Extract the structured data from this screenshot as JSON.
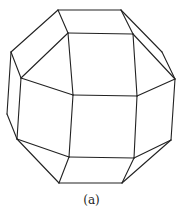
{
  "figure": {
    "type": "polyhedron-line-drawing",
    "stroke_color": "#222222",
    "caption": "(a)",
    "vertices": {
      "A": [
        58,
        10
      ],
      "B": [
        121,
        10
      ],
      "C": [
        68,
        33
      ],
      "D": [
        133,
        34
      ],
      "E": [
        11,
        52
      ],
      "F": [
        162,
        52
      ],
      "G": [
        21,
        78
      ],
      "H": [
        175,
        79
      ],
      "I": [
        73,
        95
      ],
      "J": [
        137,
        96
      ],
      "K": [
        7,
        114
      ],
      "L": [
        17,
        139
      ],
      "M": [
        69,
        157
      ],
      "N": [
        134,
        158
      ],
      "O": [
        171,
        140
      ],
      "P": [
        59,
        183
      ],
      "Q": [
        122,
        183
      ]
    },
    "edges": [
      [
        "A",
        "B"
      ],
      [
        "A",
        "C"
      ],
      [
        "B",
        "D"
      ],
      [
        "C",
        "D"
      ],
      [
        "A",
        "E"
      ],
      [
        "E",
        "G"
      ],
      [
        "C",
        "G"
      ],
      [
        "B",
        "F"
      ],
      [
        "F",
        "H"
      ],
      [
        "D",
        "H"
      ],
      [
        "C",
        "I"
      ],
      [
        "D",
        "J"
      ],
      [
        "I",
        "J"
      ],
      [
        "G",
        "I"
      ],
      [
        "H",
        "J"
      ],
      [
        "E",
        "K"
      ],
      [
        "K",
        "L"
      ],
      [
        "G",
        "L"
      ],
      [
        "I",
        "M"
      ],
      [
        "J",
        "N"
      ],
      [
        "M",
        "N"
      ],
      [
        "L",
        "M"
      ],
      [
        "H",
        "O"
      ],
      [
        "N",
        "O"
      ],
      [
        "L",
        "P"
      ],
      [
        "M",
        "P"
      ],
      [
        "P",
        "Q"
      ],
      [
        "N",
        "Q"
      ],
      [
        "O",
        "Q"
      ]
    ]
  }
}
